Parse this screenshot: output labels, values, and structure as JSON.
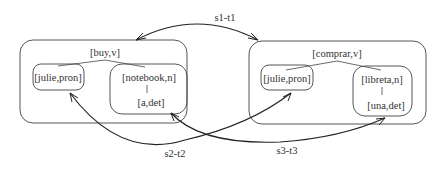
{
  "diagram": {
    "source_tree": {
      "root": "[buy,v]",
      "children": [
        {
          "label": "[julie,pron]"
        },
        {
          "label": "[notebook,n]",
          "child": "[a,det]"
        }
      ]
    },
    "target_tree": {
      "root": "[comprar,v]",
      "children": [
        {
          "label": "[julie,pron]"
        },
        {
          "label": "[libreta,n]",
          "child": "[una,det]"
        }
      ]
    },
    "links": [
      {
        "label": "s1-t1",
        "from": "[buy,v] tree",
        "to": "[comprar,v] tree"
      },
      {
        "label": "s2-t2",
        "from": "[julie,pron]",
        "to": "[julie,pron]"
      },
      {
        "label": "s3-t3",
        "from": "[notebook,n] / [a,det]",
        "to": "[libreta,n] / [una,det]"
      }
    ],
    "colors": {
      "stroke": "#222222",
      "text": "#333333",
      "background": "#ffffff"
    }
  }
}
